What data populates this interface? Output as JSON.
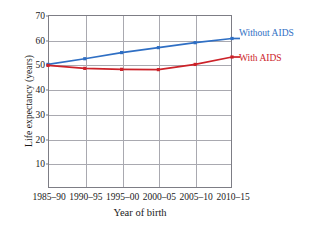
{
  "chart_data": {
    "type": "line",
    "title": "",
    "xlabel": "Year of birth",
    "ylabel": "Life expectancy (years)",
    "categories": [
      "1985–90",
      "1990–95",
      "1995–00",
      "2000–05",
      "2005–10",
      "2010–15"
    ],
    "ylim": [
      0,
      70
    ],
    "yticks": [
      0,
      10,
      20,
      30,
      40,
      50,
      60,
      70
    ],
    "ytick_labels": [
      "",
      "10",
      "20",
      "30",
      "40",
      "50",
      "60",
      "70"
    ],
    "grid": true,
    "legend_position": "right",
    "series": [
      {
        "name": "Without AIDS",
        "color": "#2f6fc4",
        "marker": "square",
        "values": [
          50.0,
          52.3,
          54.8,
          56.8,
          58.8,
          60.5
        ]
      },
      {
        "name": "With AIDS",
        "color": "#cc2229",
        "marker": "square",
        "values": [
          49.6,
          48.4,
          48.0,
          47.9,
          50.0,
          53.0
        ]
      }
    ]
  },
  "legend": {
    "without_aids": "Without AIDS",
    "with_aids": "With AIDS"
  },
  "axes": {
    "y_title": "Life expectancy (years)",
    "x_title": "Year of birth"
  }
}
